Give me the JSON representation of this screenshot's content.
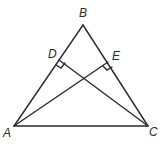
{
  "diagram": {
    "type": "geometry-triangle",
    "vertices": [
      {
        "name": "A",
        "label": "A"
      },
      {
        "name": "B",
        "label": "B"
      },
      {
        "name": "C",
        "label": "C"
      }
    ],
    "feet": [
      {
        "name": "D",
        "label": "D",
        "on_side": "AB",
        "from": "C"
      },
      {
        "name": "E",
        "label": "E",
        "on_side": "BC",
        "from": "A"
      }
    ],
    "segments": [
      "AB",
      "BC",
      "AC",
      "CD",
      "AE"
    ],
    "right_angles": [
      "CDB",
      "AEB"
    ],
    "stroke_color": "#2a2a2a"
  }
}
